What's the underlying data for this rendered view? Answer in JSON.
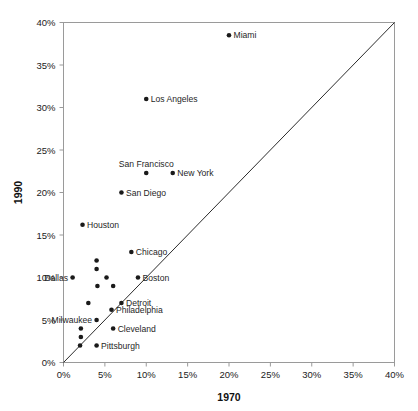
{
  "chart_data": {
    "type": "scatter",
    "title": "",
    "xlabel": "1970",
    "ylabel": "1990",
    "xlim": [
      0,
      40
    ],
    "ylim": [
      0,
      40
    ],
    "grid": false,
    "legend": "none",
    "x_ticks": [
      "0%",
      "5%",
      "10%",
      "15%",
      "20%",
      "25%",
      "30%",
      "35%",
      "40%"
    ],
    "x_tick_values": [
      0,
      5,
      10,
      15,
      20,
      25,
      30,
      35,
      40
    ],
    "y_ticks": [
      "0%",
      "5%",
      "10%",
      "15%",
      "20%",
      "25%",
      "30%",
      "35%",
      "40%"
    ],
    "y_tick_values": [
      0,
      5,
      10,
      15,
      20,
      25,
      30,
      35,
      40
    ],
    "annotations": [
      {
        "name": "reference-line",
        "kind": "line",
        "from": [
          0,
          0
        ],
        "to": [
          40,
          40
        ],
        "note": "y = x identity line"
      }
    ],
    "points": [
      {
        "label": "Miami",
        "x": 20.0,
        "y": 38.5,
        "label_pos": "right"
      },
      {
        "label": "Los Angeles",
        "x": 10.0,
        "y": 31.0,
        "label_pos": "right"
      },
      {
        "label": "San Francisco",
        "x": 10.0,
        "y": 22.3,
        "label_pos": "above"
      },
      {
        "label": "New York",
        "x": 13.2,
        "y": 22.3,
        "label_pos": "right"
      },
      {
        "label": "San Diego",
        "x": 7.0,
        "y": 20.0,
        "label_pos": "right"
      },
      {
        "label": "Houston",
        "x": 2.3,
        "y": 16.2,
        "label_pos": "right"
      },
      {
        "label": "Chicago",
        "x": 8.2,
        "y": 13.0,
        "label_pos": "right"
      },
      {
        "label": "Dallas",
        "x": 1.1,
        "y": 10.0,
        "label_pos": "left"
      },
      {
        "label": "Boston",
        "x": 9.0,
        "y": 10.0,
        "label_pos": "right"
      },
      {
        "label": "Detroit",
        "x": 7.0,
        "y": 7.0,
        "label_pos": "right"
      },
      {
        "label": "Philadelphia",
        "x": 5.8,
        "y": 6.2,
        "label_pos": "right"
      },
      {
        "label": "Milwaukee",
        "x": 4.0,
        "y": 5.0,
        "label_pos": "left"
      },
      {
        "label": "Cleveland",
        "x": 6.0,
        "y": 4.0,
        "label_pos": "right"
      },
      {
        "label": "Pittsburgh",
        "x": 4.0,
        "y": 2.0,
        "label_pos": "right"
      },
      {
        "label": "",
        "x": 4.0,
        "y": 12.0,
        "label_pos": "none"
      },
      {
        "label": "",
        "x": 4.0,
        "y": 11.0,
        "label_pos": "none"
      },
      {
        "label": "",
        "x": 5.2,
        "y": 10.0,
        "label_pos": "none"
      },
      {
        "label": "",
        "x": 4.1,
        "y": 9.0,
        "label_pos": "none"
      },
      {
        "label": "",
        "x": 6.0,
        "y": 9.0,
        "label_pos": "none"
      },
      {
        "label": "",
        "x": 3.0,
        "y": 7.0,
        "label_pos": "none"
      },
      {
        "label": "",
        "x": 2.1,
        "y": 4.0,
        "label_pos": "none"
      },
      {
        "label": "",
        "x": 2.1,
        "y": 3.0,
        "label_pos": "none"
      },
      {
        "label": "",
        "x": 2.0,
        "y": 2.0,
        "label_pos": "none"
      }
    ]
  }
}
